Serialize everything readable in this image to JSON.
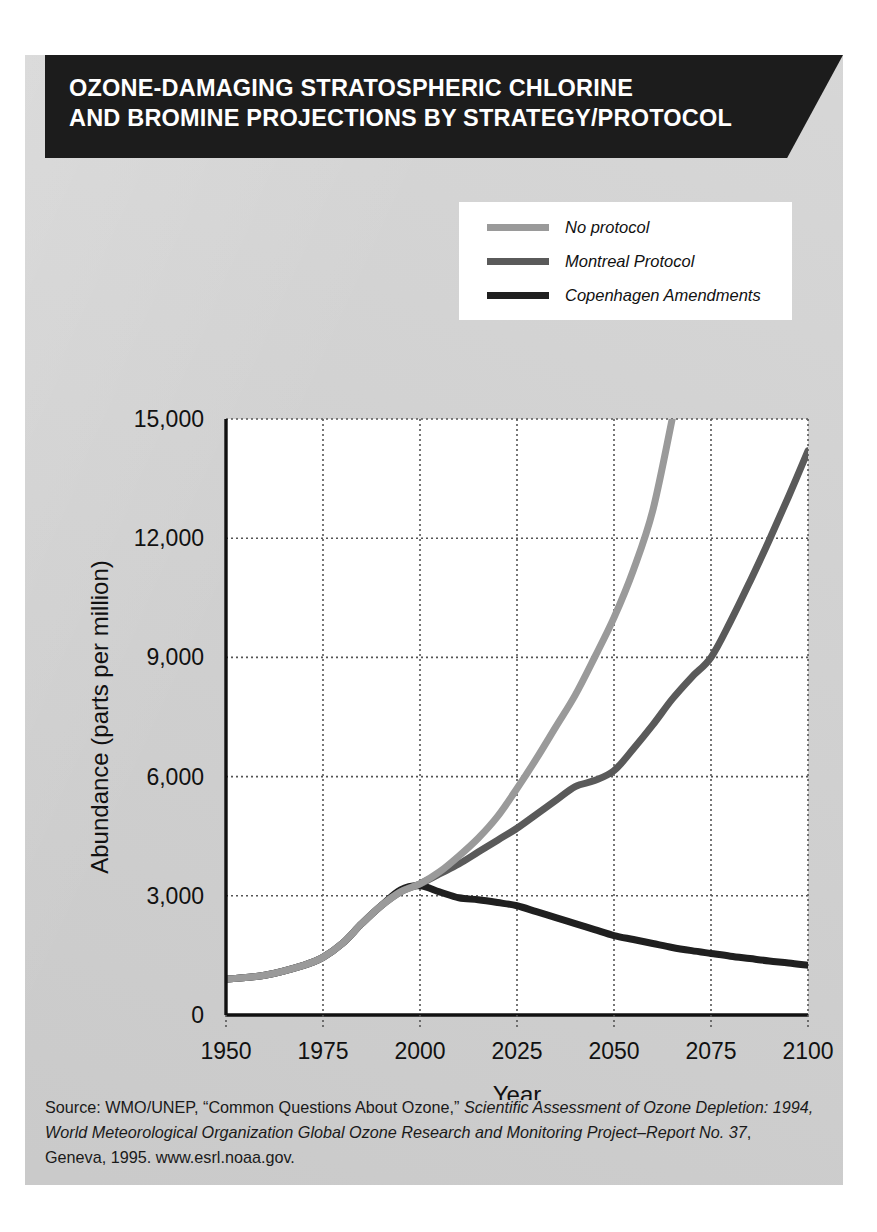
{
  "title": {
    "line1": "OZONE-DAMAGING STRATOSPHERIC CHLORINE",
    "line2": "AND BROMINE PROJECTIONS BY STRATEGY/PROTOCOL"
  },
  "colors": {
    "no_protocol": "#9a9a9a",
    "montreal": "#5a5a5a",
    "copenhagen": "#1f1f1f",
    "banner": "#1c1c1c",
    "card_background": "#d2d2d2",
    "plot_background": "#ffffff",
    "grid": "#555555",
    "axis": "#111111"
  },
  "source": {
    "prefix": "Source: WMO/UNEP, “Common Questions About Ozone,” ",
    "italic1": "Scientific Assessment of Ozone Depletion: 1994, World Meteorological Organization Global Ozone Research and Monitoring Project–Report No. 37",
    "suffix": ", Geneva, 1995. www.esrl.noaa.gov."
  },
  "chart_data": {
    "type": "line",
    "title": "Ozone-damaging stratospheric chlorine and bromine projections by strategy/protocol",
    "xlabel": "Year",
    "ylabel": "Abundance (parts per million)",
    "xlim": [
      1950,
      2100
    ],
    "ylim": [
      0,
      15000
    ],
    "xticks": [
      1950,
      1975,
      2000,
      2025,
      2050,
      2075,
      2100
    ],
    "xtick_labels": [
      "1950",
      "1975",
      "2000",
      "2025",
      "2050",
      "2075",
      "2100"
    ],
    "yticks": [
      0,
      3000,
      6000,
      9000,
      12000,
      15000
    ],
    "ytick_labels": [
      "0",
      "3,000",
      "6,000",
      "9,000",
      "12,000",
      "15,000"
    ],
    "grid": true,
    "grid_style": "dotted",
    "legend_position": "top-right-outside",
    "series": [
      {
        "name": "No protocol",
        "color": "#9a9a9a",
        "x": [
          1950,
          1960,
          1970,
          1975,
          1980,
          1985,
          1990,
          1995,
          2000,
          2005,
          2010,
          2015,
          2020,
          2025,
          2030,
          2035,
          2040,
          2045,
          2050,
          2055,
          2060,
          2065
        ],
        "values": [
          900,
          1000,
          1250,
          1450,
          1800,
          2300,
          2750,
          3100,
          3300,
          3600,
          4000,
          4450,
          5000,
          5700,
          6450,
          7250,
          8050,
          9000,
          10000,
          11200,
          12700,
          15000
        ]
      },
      {
        "name": "Montreal Protocol",
        "color": "#5a5a5a",
        "x": [
          1950,
          1960,
          1970,
          1975,
          1980,
          1985,
          1990,
          1995,
          2000,
          2005,
          2010,
          2015,
          2020,
          2025,
          2030,
          2035,
          2040,
          2045,
          2050,
          2055,
          2060,
          2065,
          2070,
          2075,
          2080,
          2085,
          2090,
          2095,
          2100
        ],
        "values": [
          900,
          1000,
          1250,
          1450,
          1800,
          2300,
          2750,
          3100,
          3300,
          3550,
          3800,
          4100,
          4400,
          4700,
          5050,
          5400,
          5750,
          5900,
          6150,
          6700,
          7300,
          7950,
          8500,
          9000,
          9900,
          10900,
          11950,
          13050,
          14200
        ]
      },
      {
        "name": "Copenhagen Amendments",
        "color": "#1f1f1f",
        "x": [
          1950,
          1960,
          1970,
          1975,
          1980,
          1985,
          1990,
          1995,
          2000,
          2005,
          2010,
          2015,
          2020,
          2025,
          2030,
          2035,
          2040,
          2045,
          2050,
          2055,
          2060,
          2065,
          2070,
          2075,
          2080,
          2085,
          2090,
          2095,
          2100
        ],
        "values": [
          900,
          1000,
          1250,
          1450,
          1800,
          2300,
          2750,
          3150,
          3250,
          3100,
          2950,
          2900,
          2830,
          2750,
          2600,
          2450,
          2300,
          2150,
          2000,
          1900,
          1800,
          1700,
          1620,
          1550,
          1480,
          1420,
          1360,
          1310,
          1250
        ]
      }
    ]
  }
}
